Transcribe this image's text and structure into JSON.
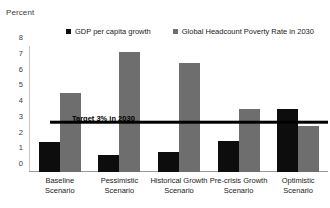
{
  "chart_data": {
    "type": "bar",
    "title": "",
    "ylabel": "Percent",
    "xlabel": "",
    "ylim": [
      0,
      8
    ],
    "ytick_step": 1,
    "yticks": [
      "0",
      "1",
      "2",
      "3",
      "4",
      "5",
      "6",
      "7",
      "8"
    ],
    "grid": false,
    "legend_position": "top",
    "categories": [
      "Baseline Scenario",
      "Pessimistic Scenario",
      "Historical Growth Scenario",
      "Pre-crisis Growth Scenario",
      "Optimistic Scenario"
    ],
    "series": [
      {
        "name": "GDP per capita growth",
        "color": "#0d0d0d",
        "values": [
          1.9,
          1.1,
          1.3,
          2.0,
          4.0
        ]
      },
      {
        "name": "Global Headcount Poverty Rate in 2030",
        "color": "#6e6e6e",
        "values": [
          5.0,
          7.6,
          6.9,
          4.0,
          2.9
        ]
      }
    ],
    "annotations": [
      {
        "name": "target-line",
        "label": "Target 3% in 2030",
        "value": 3,
        "color": "#000000"
      }
    ]
  },
  "legend": {
    "items": [
      {
        "label": "GDP per capita growth",
        "color": "#0d0d0d"
      },
      {
        "label": "Global Headcount Poverty Rate in 2030",
        "color": "#6e6e6e"
      }
    ]
  }
}
